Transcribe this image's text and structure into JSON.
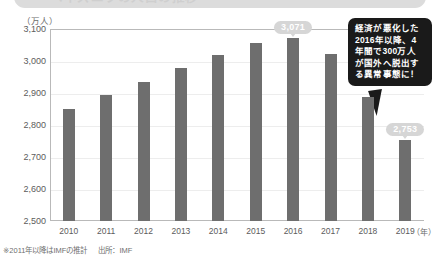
{
  "title": {
    "text": "ベネズエラの人口の推移",
    "visible_partial": true
  },
  "chart_data": {
    "type": "bar",
    "title": "ベネズエラの人口の推移",
    "xlabel": "(年)",
    "ylabel": "(万人)",
    "categories": [
      "2010",
      "2011",
      "2012",
      "2013",
      "2014",
      "2015",
      "2016",
      "2017",
      "2018",
      "2019"
    ],
    "values": [
      2851,
      2894,
      2935,
      2977,
      3018,
      3057,
      3071,
      3023,
      2886,
      2753
    ],
    "ylim": [
      2500,
      3100
    ],
    "yticks": [
      "2,500",
      "2,600",
      "2,700",
      "2,800",
      "2,900",
      "3,000",
      "3,100"
    ],
    "ytick_values": [
      2500,
      2600,
      2700,
      2800,
      2900,
      3000,
      3100
    ],
    "grid": true,
    "legend": "none",
    "bar_color": "#6e6e6e",
    "data_labels": [
      {
        "category": "2016",
        "label": "3,071"
      },
      {
        "category": "2019",
        "label": "2,753"
      }
    ],
    "annotations": [
      {
        "name": "callout",
        "lines": [
          "経済が悪化した",
          "2016年以降、4",
          "年間で300万人",
          "が国外へ脱出す",
          "る異常事態に！"
        ],
        "background": "#1a1a1a",
        "text_color": "#ffffff"
      }
    ]
  },
  "axis": {
    "y_unit": "（万人）",
    "x_unit": "（年）"
  },
  "footnote": {
    "note": "※2011年以降はIMFの推計",
    "source": "出所：IMF"
  }
}
